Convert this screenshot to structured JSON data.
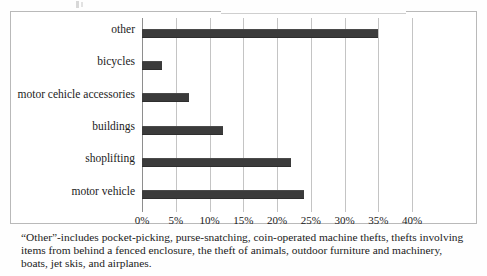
{
  "chart_data": {
    "type": "bar",
    "orientation": "horizontal",
    "title": "",
    "subtitle": "",
    "xlabel": "",
    "ylabel": "",
    "categories": [
      "other",
      "bicycles",
      "motor cehicle accessories",
      "buildings",
      "shoplifting",
      "motor vehicle"
    ],
    "values": [
      35,
      3,
      7,
      12,
      22,
      24
    ],
    "value_unit": "%",
    "xlim": [
      0,
      42.5
    ],
    "xticks": [
      0,
      5,
      10,
      15,
      20,
      25,
      30,
      35,
      40
    ],
    "xtick_labels": [
      "0%",
      "5%",
      "10%",
      "15%",
      "20%",
      "25%",
      "30%",
      "35%",
      "40%"
    ],
    "grid": true,
    "grid_axis": "x",
    "legend": false,
    "bar_color": "#3b3b3b",
    "gridline_color": "#c4c4c4",
    "axis_color": "#8e8e8e",
    "frame_color": "#b9b9b9",
    "background_color": "#ffffff"
  },
  "caption": {
    "line1": "“Other”-includes pocket-picking, purse-snatching, coin-operated machine thefts, thefts involving",
    "line2": "items from behind a fenced enclosure, the theft of animals, outdoor furniture and machinery,",
    "line3": "boats, jet skis, and airplanes."
  }
}
